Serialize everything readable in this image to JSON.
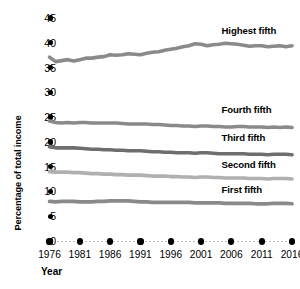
{
  "chart_data": {
    "type": "line",
    "title": "",
    "xlabel": "Year",
    "ylabel": "Percentage of total income",
    "grid": false,
    "legend_position": "inline-right",
    "xlim": [
      1976,
      2016
    ],
    "ylim": [
      0,
      45
    ],
    "ytick_labels": [
      "45",
      "40",
      "35",
      "30",
      "25",
      "20",
      "15",
      "10",
      "5",
      "0"
    ],
    "ytick_values": [
      45,
      40,
      35,
      30,
      25,
      20,
      15,
      10,
      5,
      0
    ],
    "xtick_labels": [
      "1976",
      "1981",
      "1986",
      "1991",
      "1996",
      "2001",
      "2006",
      "2011",
      "2016"
    ],
    "xtick_values": [
      1976,
      1981,
      1986,
      1991,
      1996,
      2001,
      2006,
      2011,
      2016
    ],
    "x": [
      1976,
      1977,
      1978,
      1979,
      1980,
      1981,
      1982,
      1983,
      1984,
      1985,
      1986,
      1987,
      1988,
      1989,
      1990,
      1991,
      1992,
      1993,
      1994,
      1995,
      1996,
      1997,
      1998,
      1999,
      2000,
      2001,
      2002,
      2003,
      2004,
      2005,
      2006,
      2007,
      2008,
      2009,
      2010,
      2011,
      2012,
      2013,
      2014,
      2015,
      2016
    ],
    "series": [
      {
        "name": "Highest fifth",
        "color": "#8a8a8a",
        "label_x": 2008,
        "label_y": 42.3,
        "values": [
          37.1,
          36.2,
          36.4,
          36.6,
          36.3,
          36.6,
          36.9,
          36.9,
          37.1,
          37.2,
          37.6,
          37.5,
          37.6,
          37.8,
          37.7,
          37.6,
          37.9,
          38.1,
          38.2,
          38.5,
          38.7,
          38.9,
          39.2,
          39.4,
          39.8,
          39.7,
          39.4,
          39.6,
          39.7,
          39.9,
          39.8,
          39.7,
          39.5,
          39.3,
          39.4,
          39.4,
          39.2,
          39.3,
          39.4,
          39.2,
          39.4
        ]
      },
      {
        "name": "Fourth fifth",
        "color": "#8a8a8a",
        "label_x": 2008,
        "label_y": 26.5,
        "values": [
          24.2,
          23.9,
          23.8,
          23.9,
          23.8,
          23.9,
          23.9,
          23.8,
          23.8,
          23.8,
          23.8,
          23.8,
          23.7,
          23.6,
          23.6,
          23.6,
          23.6,
          23.5,
          23.5,
          23.4,
          23.3,
          23.3,
          23.2,
          23.2,
          23.1,
          23.2,
          23.2,
          23.1,
          23.1,
          23.0,
          23.0,
          23.1,
          23.1,
          23.0,
          23.0,
          23.0,
          22.9,
          23.0,
          22.9,
          23.0,
          22.9
        ]
      },
      {
        "name": "Third fifth",
        "color": "#6e6e6e",
        "label_x": 2008,
        "label_y": 20.7,
        "values": [
          19.0,
          18.8,
          18.8,
          18.8,
          18.8,
          18.7,
          18.6,
          18.5,
          18.5,
          18.4,
          18.4,
          18.3,
          18.3,
          18.2,
          18.2,
          18.2,
          18.1,
          18.0,
          18.0,
          17.9,
          17.9,
          17.8,
          17.8,
          17.8,
          17.7,
          17.8,
          17.8,
          17.7,
          17.6,
          17.6,
          17.6,
          17.6,
          17.6,
          17.5,
          17.5,
          17.5,
          17.4,
          17.5,
          17.5,
          17.5,
          17.4
        ]
      },
      {
        "name": "Second fifth",
        "color": "#b0b0b0",
        "label_x": 2008,
        "label_y": 15.4,
        "values": [
          14.0,
          13.9,
          13.9,
          13.9,
          13.8,
          13.8,
          13.7,
          13.6,
          13.6,
          13.5,
          13.5,
          13.4,
          13.4,
          13.3,
          13.3,
          13.3,
          13.2,
          13.1,
          13.1,
          13.1,
          13.0,
          13.0,
          12.9,
          12.9,
          12.8,
          12.9,
          12.9,
          12.8,
          12.8,
          12.7,
          12.7,
          12.7,
          12.7,
          12.6,
          12.6,
          12.6,
          12.5,
          12.6,
          12.6,
          12.6,
          12.5
        ]
      },
      {
        "name": "First fifth",
        "color": "#8a8a8a",
        "label_x": 2008,
        "label_y": 10.3,
        "values": [
          8.0,
          7.9,
          8.0,
          8.0,
          8.0,
          7.9,
          7.9,
          7.9,
          8.0,
          8.0,
          8.1,
          8.1,
          8.1,
          8.1,
          8.0,
          7.9,
          7.9,
          7.8,
          7.8,
          7.8,
          7.8,
          7.8,
          7.8,
          7.8,
          7.7,
          7.7,
          7.7,
          7.7,
          7.7,
          7.6,
          7.6,
          7.6,
          7.6,
          7.6,
          7.5,
          7.5,
          7.5,
          7.6,
          7.6,
          7.6,
          7.5
        ]
      }
    ]
  }
}
